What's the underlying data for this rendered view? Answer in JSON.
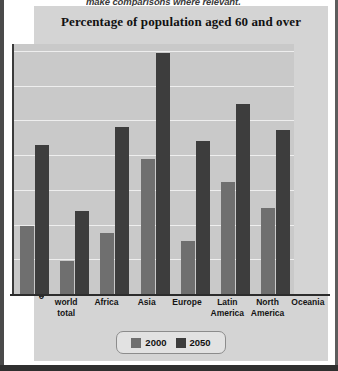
{
  "page": {
    "cutoff_text": "make comparisons where relevant."
  },
  "chart_data": {
    "type": "bar",
    "title": "Percentage of population aged 60 and over",
    "xlabel": "",
    "ylabel": "",
    "ylim": [
      0,
      36
    ],
    "grid": true,
    "legend_position": "bottom",
    "categories": [
      "world\ntotal",
      "Africa",
      "Asia",
      "Europe",
      "Latin\nAmerica",
      "North\nAmerica",
      "Oceania"
    ],
    "series": [
      {
        "name": "2000",
        "color": "#6f6f6f",
        "values": [
          9.8,
          4.8,
          8.8,
          19.5,
          7.6,
          16.1,
          12.4
        ]
      },
      {
        "name": "2050",
        "color": "#3d3d3d",
        "values": [
          21.5,
          12.0,
          24.0,
          34.7,
          22.0,
          27.3,
          23.6
        ]
      }
    ],
    "yticks": [
      {
        "value": 35,
        "label": "35%"
      },
      {
        "value": 30,
        "label": "30%"
      },
      {
        "value": 25,
        "label": "25%"
      },
      {
        "value": 20,
        "label": "20%"
      },
      {
        "value": 15,
        "label": "15%"
      },
      {
        "value": 10,
        "label": "10%"
      },
      {
        "value": 5,
        "label": "5%"
      },
      {
        "value": 0,
        "label": "0"
      }
    ]
  }
}
